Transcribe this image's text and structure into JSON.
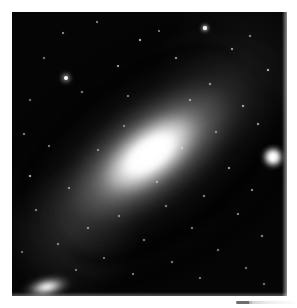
{
  "viewer": {
    "background_color": "#ffffff",
    "photo": {
      "subject": "spiral-galaxy",
      "orientation": "major axis from upper-left to lower-right",
      "frame": {
        "x": 12,
        "y": 12,
        "width": 275,
        "height": 284
      },
      "background_color": "#050505",
      "core_color": "#ffffff",
      "halo_color": "#b4b4b4",
      "dust_lane_color": "#000000"
    },
    "objects": [
      {
        "name": "main-galaxy-core",
        "label": "bright nucleus",
        "cx": 152,
        "cy": 155,
        "brightness": "saturated white"
      },
      {
        "name": "companion-galaxy-right",
        "label": "round companion near right edge",
        "cx": 261,
        "cy": 145,
        "brightness": "very bright"
      },
      {
        "name": "companion-galaxy-bottom-left",
        "label": "elongated companion at lower left",
        "cx": 35,
        "cy": 275,
        "brightness": "bright"
      }
    ],
    "dust_lanes": [
      {
        "name": "inner-northeast-lane",
        "side": "upper-left of core"
      },
      {
        "name": "outer-northeast-lane",
        "side": "upper-left outer"
      },
      {
        "name": "inner-southwest-lane",
        "side": "lower-right of core"
      },
      {
        "name": "outer-southwest-lane",
        "side": "lower-right outer"
      }
    ],
    "stars": [
      {
        "x": 205,
        "y": 28,
        "r": 1.6,
        "o": 0.95
      },
      {
        "x": 140,
        "y": 40,
        "r": 1.2,
        "o": 0.8
      },
      {
        "x": 232,
        "y": 49,
        "r": 1.1,
        "o": 0.7
      },
      {
        "x": 63,
        "y": 33,
        "r": 1.0,
        "o": 0.62
      },
      {
        "x": 97,
        "y": 22,
        "r": 0.9,
        "o": 0.55
      },
      {
        "x": 176,
        "y": 58,
        "r": 1.0,
        "o": 0.66
      },
      {
        "x": 250,
        "y": 36,
        "r": 0.9,
        "o": 0.58
      },
      {
        "x": 118,
        "y": 66,
        "r": 1.1,
        "o": 0.72
      },
      {
        "x": 44,
        "y": 58,
        "r": 0.9,
        "o": 0.52
      },
      {
        "x": 268,
        "y": 70,
        "r": 1.3,
        "o": 0.78
      },
      {
        "x": 210,
        "y": 84,
        "r": 1.0,
        "o": 0.64
      },
      {
        "x": 82,
        "y": 92,
        "r": 0.9,
        "o": 0.55
      },
      {
        "x": 159,
        "y": 31,
        "r": 0.8,
        "o": 0.5
      },
      {
        "x": 66,
        "y": 78,
        "r": 2.1,
        "o": 1.0
      },
      {
        "x": 30,
        "y": 100,
        "r": 0.9,
        "o": 0.5
      },
      {
        "x": 243,
        "y": 106,
        "r": 1.2,
        "o": 0.72
      },
      {
        "x": 190,
        "y": 100,
        "r": 1.0,
        "o": 0.6
      },
      {
        "x": 128,
        "y": 96,
        "r": 0.9,
        "o": 0.55
      },
      {
        "x": 258,
        "y": 124,
        "r": 1.1,
        "o": 0.68
      },
      {
        "x": 24,
        "y": 134,
        "r": 1.0,
        "o": 0.58
      },
      {
        "x": 49,
        "y": 146,
        "r": 0.9,
        "o": 0.52
      },
      {
        "x": 272,
        "y": 160,
        "r": 1.0,
        "o": 0.6
      },
      {
        "x": 229,
        "y": 168,
        "r": 1.2,
        "o": 0.7
      },
      {
        "x": 30,
        "y": 176,
        "r": 1.4,
        "o": 0.8
      },
      {
        "x": 69,
        "y": 188,
        "r": 1.0,
        "o": 0.58
      },
      {
        "x": 252,
        "y": 190,
        "r": 1.1,
        "o": 0.64
      },
      {
        "x": 204,
        "y": 196,
        "r": 1.0,
        "o": 0.6
      },
      {
        "x": 166,
        "y": 206,
        "r": 0.9,
        "o": 0.55
      },
      {
        "x": 119,
        "y": 216,
        "r": 1.0,
        "o": 0.58
      },
      {
        "x": 88,
        "y": 228,
        "r": 1.1,
        "o": 0.62
      },
      {
        "x": 238,
        "y": 214,
        "r": 1.0,
        "o": 0.6
      },
      {
        "x": 192,
        "y": 228,
        "r": 0.9,
        "o": 0.52
      },
      {
        "x": 144,
        "y": 240,
        "r": 1.0,
        "o": 0.58
      },
      {
        "x": 58,
        "y": 244,
        "r": 1.0,
        "o": 0.58
      },
      {
        "x": 262,
        "y": 236,
        "r": 1.1,
        "o": 0.62
      },
      {
        "x": 218,
        "y": 250,
        "r": 1.0,
        "o": 0.56
      },
      {
        "x": 104,
        "y": 258,
        "r": 0.9,
        "o": 0.5
      },
      {
        "x": 172,
        "y": 262,
        "r": 1.0,
        "o": 0.56
      },
      {
        "x": 246,
        "y": 268,
        "r": 0.9,
        "o": 0.52
      },
      {
        "x": 133,
        "y": 274,
        "r": 1.0,
        "o": 0.56
      },
      {
        "x": 200,
        "y": 278,
        "r": 0.9,
        "o": 0.5
      },
      {
        "x": 76,
        "y": 270,
        "r": 0.9,
        "o": 0.5
      },
      {
        "x": 36,
        "y": 210,
        "r": 1.0,
        "o": 0.55
      },
      {
        "x": 264,
        "y": 284,
        "r": 0.9,
        "o": 0.5
      },
      {
        "x": 22,
        "y": 252,
        "r": 0.9,
        "o": 0.48
      },
      {
        "x": 157,
        "y": 182,
        "r": 0.8,
        "o": 0.48
      },
      {
        "x": 98,
        "y": 150,
        "r": 0.9,
        "o": 0.52
      },
      {
        "x": 124,
        "y": 126,
        "r": 0.8,
        "o": 0.46
      },
      {
        "x": 182,
        "y": 148,
        "r": 0.8,
        "o": 0.44
      },
      {
        "x": 216,
        "y": 132,
        "r": 0.9,
        "o": 0.52
      }
    ],
    "artifact": {
      "name": "scan-edge-artifact",
      "x": 236,
      "y": 301,
      "width": 58,
      "height": 3
    }
  }
}
